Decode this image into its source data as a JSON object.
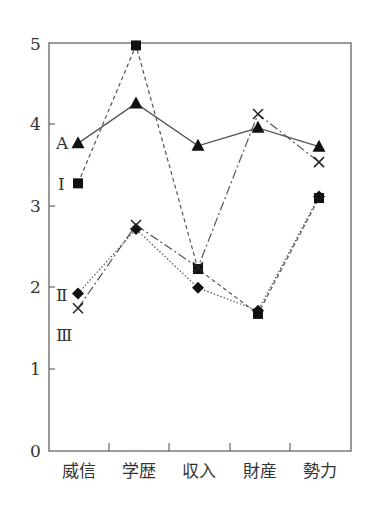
{
  "chart_data": {
    "type": "line",
    "title": "",
    "xlabel": "",
    "ylabel": "",
    "categories": [
      "威信",
      "学歴",
      "収入",
      "財産",
      "勢力"
    ],
    "ylim": [
      0,
      5
    ],
    "yticks": [
      0,
      1,
      2,
      3,
      4,
      5
    ],
    "grid": false,
    "legend": "inline labels at left of first point",
    "series": [
      {
        "name": "A",
        "marker": "triangle",
        "line": "solid",
        "values": [
          3.77,
          4.26,
          3.74,
          3.96,
          3.73
        ]
      },
      {
        "name": "Ⅰ",
        "marker": "square",
        "line": "dashed",
        "values": [
          3.28,
          4.97,
          2.23,
          1.68,
          3.1
        ]
      },
      {
        "name": "Ⅱ",
        "marker": "diamond",
        "line": "dotted",
        "values": [
          1.93,
          2.72,
          2.0,
          1.72,
          3.12
        ]
      },
      {
        "name": "Ⅲ",
        "marker": "x",
        "line": "dash-dot",
        "values": [
          1.75,
          2.77,
          2.25,
          4.13,
          3.54
        ]
      }
    ]
  },
  "labels": {
    "y0": "0",
    "y1": "1",
    "y2": "2",
    "y3": "3",
    "y4": "4",
    "y5": "5",
    "cat0": "威信",
    "cat1": "学歴",
    "cat2": "収入",
    "cat3": "財産",
    "cat4": "勢力",
    "sA": "A",
    "sI": "Ⅰ",
    "sII": "Ⅱ",
    "sIII": "Ⅲ"
  }
}
